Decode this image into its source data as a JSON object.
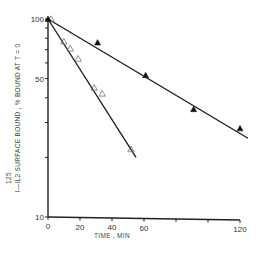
{
  "chart_data": {
    "type": "scatter",
    "title": "",
    "xlabel": "TIME , MIN",
    "ylabel": "125 I-IL2 SURFACE BOUND , % BOUND AT T = 0",
    "ylabel_superscript": "125",
    "ylabel_main": "I—IL2 SURFACE BOUND , % BOUND AT T = 0",
    "xlim": [
      0,
      120
    ],
    "ylim": [
      10,
      100
    ],
    "yscale": "log",
    "grid": false,
    "legend": null,
    "x_ticks": [
      0,
      20,
      40,
      60,
      80,
      100,
      120
    ],
    "x_tick_labels": [
      "0",
      "20",
      "40",
      "60",
      "",
      "",
      "120"
    ],
    "y_ticks": [
      10,
      20,
      30,
      40,
      50,
      60,
      70,
      80,
      90,
      100
    ],
    "y_tick_labels": [
      "10",
      "",
      "",
      "",
      "50",
      "",
      "",
      "",
      "",
      "100"
    ],
    "series": [
      {
        "name": "open triangles (fast)",
        "marker": "open-triangle",
        "x": [
          0,
          8,
          12,
          17,
          27,
          32,
          50
        ],
        "y": [
          100,
          77,
          71,
          63,
          45,
          42,
          22
        ],
        "fit_line": {
          "x": [
            0,
            55
          ],
          "y": [
            100,
            20
          ]
        }
      },
      {
        "name": "filled triangles (slow)",
        "marker": "filled-triangle",
        "x": [
          0,
          31,
          61,
          91,
          120
        ],
        "y": [
          100,
          76,
          52,
          35,
          28
        ],
        "fit_line": {
          "x": [
            0,
            125
          ],
          "y": [
            100,
            25
          ]
        }
      }
    ]
  }
}
